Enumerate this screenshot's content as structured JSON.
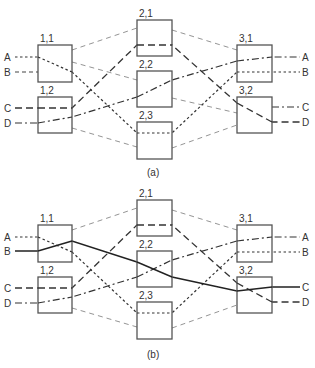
{
  "figure": {
    "panels": [
      {
        "caption": "(a)",
        "stage1": [
          {
            "label": "1,1"
          },
          {
            "label": "1,2"
          }
        ],
        "stage2": [
          {
            "label": "2,1"
          },
          {
            "label": "2,2"
          },
          {
            "label": "2,3"
          }
        ],
        "stage3": [
          {
            "label": "3,1"
          },
          {
            "label": "3,2"
          }
        ],
        "inputs": [
          "A",
          "B",
          "C",
          "D"
        ],
        "outputs": [
          "A",
          "B",
          "C",
          "D"
        ]
      },
      {
        "caption": "(b)",
        "stage1": [
          {
            "label": "1,1"
          },
          {
            "label": "1,2"
          }
        ],
        "stage2": [
          {
            "label": "2,1"
          },
          {
            "label": "2,2"
          },
          {
            "label": "2,3"
          }
        ],
        "stage3": [
          {
            "label": "3,1"
          },
          {
            "label": "3,2"
          }
        ],
        "inputs": [
          "A",
          "B",
          "C",
          "D"
        ],
        "outputs": [
          "A",
          "B",
          "C",
          "D"
        ]
      }
    ],
    "colors": {
      "box_stroke": "#555555",
      "link": "#888888",
      "path": "#333333",
      "solid_path": "#222222"
    }
  }
}
